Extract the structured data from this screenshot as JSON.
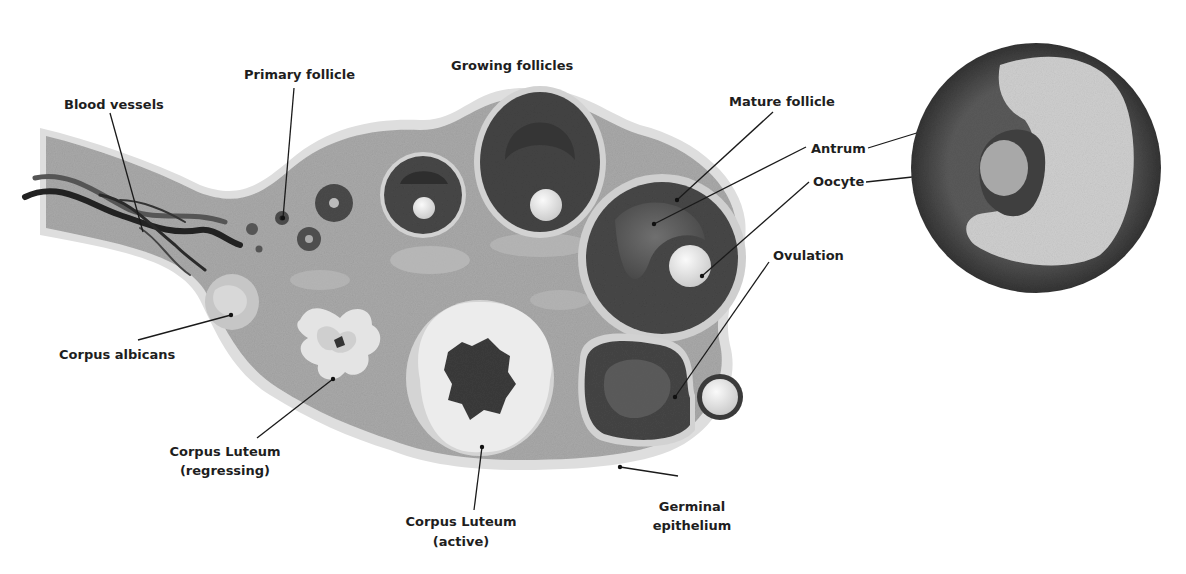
{
  "diagram": {
    "colors": {
      "background": "#ffffff",
      "ovary_fill": "#a9a9a9",
      "ovary_rim": "#dcdcdc",
      "follicle_dark": "#3f3f3f",
      "follicle_mid": "#5e5e5e",
      "oocyte": "#e6e6e6",
      "corpus_light": "#e9e9e9",
      "label_text": "#1e1e1e",
      "leader_line": "#1a1a1a"
    },
    "labels": {
      "blood_vessels": "Blood vessels",
      "primary_follicle": "Primary follicle",
      "growing_follicles": "Growing follicles",
      "mature_follicle": "Mature follicle",
      "antrum": "Antrum",
      "oocyte": "Oocyte",
      "ovulation": "Ovulation",
      "corpus_albicans": "Corpus albicans",
      "corpus_luteum_regressing_line1": "Corpus Luteum",
      "corpus_luteum_regressing_line2": "(regressing)",
      "corpus_luteum_active_line1": "Corpus Luteum",
      "corpus_luteum_active_line2": "(active)",
      "germinal_epithelium_line1": "Germinal",
      "germinal_epithelium_line2": "epithelium"
    },
    "inset": {
      "description": "Micrograph of mature follicle",
      "labels_shared": [
        "Antrum",
        "Oocyte"
      ]
    }
  }
}
